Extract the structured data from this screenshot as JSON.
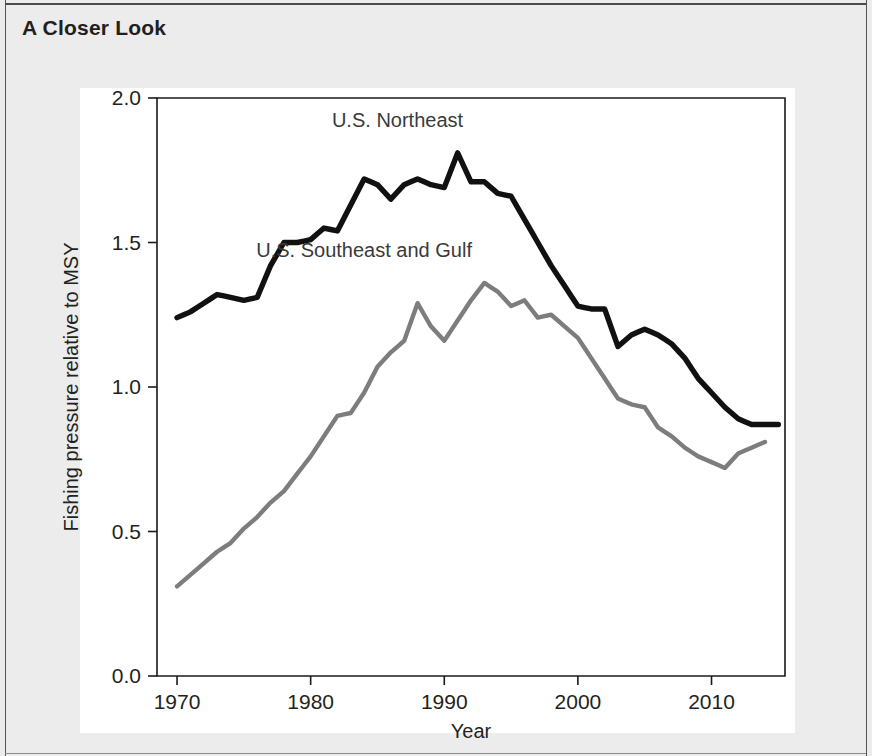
{
  "page": {
    "heading": "A Closer Look",
    "background_color": "#ececec",
    "panel_color": "#ffffff"
  },
  "chart_data": {
    "type": "line",
    "title": "",
    "xlabel": "Year",
    "ylabel": "Fishing pressure relative to MSY",
    "xlim": [
      1968.5,
      2015.5
    ],
    "ylim": [
      0.0,
      2.0
    ],
    "xticks": [
      1970,
      1980,
      1990,
      2000,
      2010
    ],
    "xticklabels": [
      "1970",
      "1980",
      "1990",
      "2000",
      "2010"
    ],
    "yticks": [
      0.0,
      0.5,
      1.0,
      1.5,
      2.0
    ],
    "yticklabels": [
      "0.0",
      "0.5",
      "1.0",
      "1.5",
      "2.0"
    ],
    "grid": false,
    "legend": "inline-labels",
    "annotations": [
      {
        "text": "U.S. Northeast",
        "x": 1986.5,
        "y": 1.9,
        "color": "#3a3a3a"
      },
      {
        "text": "U.S. Southeast and Gulf",
        "x": 1984.0,
        "y": 1.45,
        "color": "#3a3a3a"
      }
    ],
    "series": [
      {
        "name": "U.S. Northeast",
        "color": "#111111",
        "linewidth": 5.4,
        "x": [
          1970,
          1971,
          1972,
          1973,
          1974,
          1975,
          1976,
          1977,
          1978,
          1979,
          1980,
          1981,
          1982,
          1983,
          1984,
          1985,
          1986,
          1987,
          1988,
          1989,
          1990,
          1991,
          1992,
          1993,
          1994,
          1995,
          1996,
          1997,
          1998,
          1999,
          2000,
          2001,
          2002,
          2003,
          2004,
          2005,
          2006,
          2007,
          2008,
          2009,
          2010,
          2011,
          2012,
          2013,
          2014,
          2015
        ],
        "values": [
          1.24,
          1.26,
          1.29,
          1.32,
          1.31,
          1.3,
          1.31,
          1.42,
          1.5,
          1.5,
          1.51,
          1.55,
          1.54,
          1.63,
          1.72,
          1.7,
          1.65,
          1.7,
          1.72,
          1.7,
          1.69,
          1.81,
          1.71,
          1.71,
          1.67,
          1.66,
          1.58,
          1.5,
          1.42,
          1.35,
          1.28,
          1.27,
          1.27,
          1.14,
          1.18,
          1.2,
          1.18,
          1.15,
          1.1,
          1.03,
          0.98,
          0.93,
          0.89,
          0.87,
          0.87,
          0.87
        ]
      },
      {
        "name": "U.S. Southeast and Gulf",
        "color": "#7d7d7d",
        "linewidth": 4.4,
        "x": [
          1970,
          1971,
          1972,
          1973,
          1974,
          1975,
          1976,
          1977,
          1978,
          1979,
          1980,
          1981,
          1982,
          1983,
          1984,
          1985,
          1986,
          1987,
          1988,
          1989,
          1990,
          1991,
          1992,
          1993,
          1994,
          1995,
          1996,
          1997,
          1998,
          1999,
          2000,
          2001,
          2002,
          2003,
          2004,
          2005,
          2006,
          2007,
          2008,
          2009,
          2010,
          2011,
          2012,
          2013,
          2014
        ],
        "values": [
          0.31,
          0.35,
          0.39,
          0.43,
          0.46,
          0.51,
          0.55,
          0.6,
          0.64,
          0.7,
          0.76,
          0.83,
          0.9,
          0.91,
          0.98,
          1.07,
          1.12,
          1.16,
          1.29,
          1.21,
          1.16,
          1.23,
          1.3,
          1.36,
          1.33,
          1.28,
          1.3,
          1.24,
          1.25,
          1.21,
          1.17,
          1.1,
          1.03,
          0.96,
          0.94,
          0.93,
          0.86,
          0.83,
          0.79,
          0.76,
          0.74,
          0.72,
          0.77,
          0.79,
          0.81
        ]
      }
    ]
  }
}
